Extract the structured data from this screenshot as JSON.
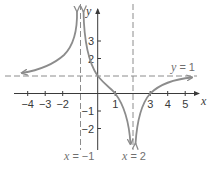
{
  "graph": {
    "axis_labels": {
      "x": "x",
      "y": "y"
    },
    "x_ticks": [
      {
        "value": -4,
        "label": "−4"
      },
      {
        "value": -3,
        "label": "−3"
      },
      {
        "value": -2,
        "label": "−2"
      },
      {
        "value": 1,
        "label": "1"
      },
      {
        "value": 3,
        "label": "3"
      },
      {
        "value": 4,
        "label": "4"
      },
      {
        "value": 5,
        "label": "5"
      }
    ],
    "y_ticks": [
      {
        "value": 3,
        "label": "3"
      },
      {
        "value": 2,
        "label": "2"
      },
      {
        "value": -1,
        "label": "−1"
      },
      {
        "value": -2,
        "label": "−2"
      }
    ],
    "asymptotes": {
      "horizontal": {
        "label_var": "y",
        "label_eq": " = 1",
        "value": 1
      },
      "vertical_left": {
        "label_var": "x",
        "label_eq": " = −1",
        "value": -1
      },
      "vertical_right": {
        "label_var": "x",
        "label_eq": " = 2",
        "value": 2
      }
    },
    "key_points": [
      [
        0,
        1
      ],
      [
        1,
        0
      ],
      [
        3,
        0
      ]
    ],
    "colors": {
      "curve": "#8c8c8c",
      "axis": "#3a3a3a",
      "asymptote": "#8c8c8c",
      "text": "#3a3a3a"
    }
  }
}
